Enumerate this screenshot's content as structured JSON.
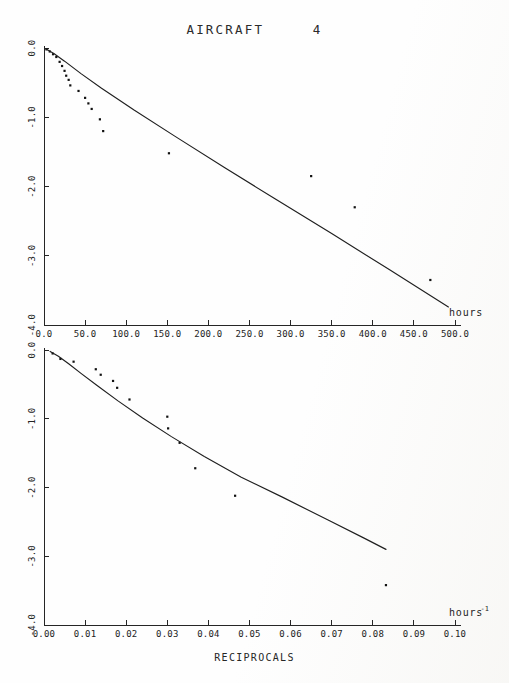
{
  "document": {
    "title": "AIRCRAFT     4"
  },
  "caption": {
    "x_caption": "RECIPROCALS"
  },
  "chart_data": [
    {
      "type": "scatter",
      "id": "top",
      "title": "AIRCRAFT     4",
      "xlabel": "hours",
      "xlabel_sup": "",
      "ylabel": "",
      "xlim": [
        0,
        500
      ],
      "ylim": [
        -4.0,
        0.0
      ],
      "grid": false,
      "legend": "none",
      "xticks": [
        0,
        50,
        100,
        150,
        200,
        250,
        300,
        350,
        400,
        450,
        500
      ],
      "xticklabels": [
        "0.0",
        "50.0",
        "100.0",
        "150.0",
        "200.0",
        "250.0",
        "300.0",
        "350.0",
        "400.0",
        "450.0",
        "500.0"
      ],
      "yticks": [
        0.0,
        -1.0,
        -2.0,
        -3.0,
        -4.0
      ],
      "yticklabels": [
        "0.0",
        "-1.0",
        "-2.0",
        "-3.0",
        "-4.0"
      ],
      "series": [
        {
          "name": "observed",
          "type": "scatter",
          "points": [
            [
              3,
              -0.02
            ],
            [
              7,
              -0.05
            ],
            [
              11,
              -0.09
            ],
            [
              15,
              -0.13
            ],
            [
              19,
              -0.2
            ],
            [
              22,
              -0.26
            ],
            [
              25,
              -0.33
            ],
            [
              27,
              -0.4
            ],
            [
              30,
              -0.46
            ],
            [
              32,
              -0.54
            ],
            [
              42,
              -0.62
            ],
            [
              50,
              -0.72
            ],
            [
              54,
              -0.8
            ],
            [
              58,
              -0.88
            ],
            [
              68,
              -1.03
            ],
            [
              72,
              -1.2
            ],
            [
              152,
              -1.52
            ],
            [
              325,
              -1.85
            ],
            [
              378,
              -2.3
            ],
            [
              470,
              -3.35
            ]
          ]
        },
        {
          "name": "fitted",
          "type": "line",
          "points": [
            [
              2,
              -0.01
            ],
            [
              12,
              -0.08
            ],
            [
              25,
              -0.19
            ],
            [
              45,
              -0.37
            ],
            [
              70,
              -0.58
            ],
            [
              110,
              -0.9
            ],
            [
              160,
              -1.28
            ],
            [
              220,
              -1.73
            ],
            [
              280,
              -2.17
            ],
            [
              350,
              -2.68
            ],
            [
              420,
              -3.2
            ],
            [
              492,
              -3.74
            ]
          ]
        }
      ]
    },
    {
      "type": "scatter",
      "id": "bottom",
      "title": "",
      "xlabel": "hours",
      "xlabel_sup": "-1",
      "ylabel": "",
      "xlim": [
        0.0,
        0.1
      ],
      "ylim": [
        -4.0,
        0.0
      ],
      "grid": false,
      "legend": "none",
      "xticks": [
        0.0,
        0.01,
        0.02,
        0.03,
        0.04,
        0.05,
        0.06,
        0.07,
        0.08,
        0.09,
        0.1
      ],
      "xticklabels": [
        "0.00",
        "0.01",
        "0.02",
        "0.03",
        "0.04",
        "0.05",
        "0.06",
        "0.07",
        "0.08",
        "0.09",
        "0.10"
      ],
      "yticks": [
        0.0,
        -1.0,
        -2.0,
        -3.0,
        -4.0
      ],
      "yticklabels": [
        "0.0",
        "-1.0",
        "-2.0",
        "-3.0",
        "-4.0"
      ],
      "series": [
        {
          "name": "observed",
          "type": "scatter",
          "points": [
            [
              0.0021,
              -0.05
            ],
            [
              0.004,
              -0.13
            ],
            [
              0.0072,
              -0.17
            ],
            [
              0.0126,
              -0.28
            ],
            [
              0.0138,
              -0.36
            ],
            [
              0.0168,
              -0.45
            ],
            [
              0.0178,
              -0.55
            ],
            [
              0.0208,
              -0.72
            ],
            [
              0.03,
              -0.97
            ],
            [
              0.0302,
              -1.14
            ],
            [
              0.033,
              -1.35
            ],
            [
              0.0368,
              -1.72
            ],
            [
              0.0465,
              -2.12
            ],
            [
              0.0832,
              -3.42
            ]
          ]
        },
        {
          "name": "fitted",
          "type": "line",
          "points": [
            [
              0.0015,
              -0.02
            ],
            [
              0.0035,
              -0.09
            ],
            [
              0.006,
              -0.2
            ],
            [
              0.009,
              -0.34
            ],
            [
              0.013,
              -0.52
            ],
            [
              0.018,
              -0.74
            ],
            [
              0.024,
              -0.99
            ],
            [
              0.031,
              -1.26
            ],
            [
              0.039,
              -1.55
            ],
            [
              0.048,
              -1.85
            ],
            [
              0.058,
              -2.14
            ],
            [
              0.069,
              -2.47
            ],
            [
              0.078,
              -2.74
            ],
            [
              0.0832,
              -2.9
            ]
          ]
        }
      ]
    }
  ]
}
